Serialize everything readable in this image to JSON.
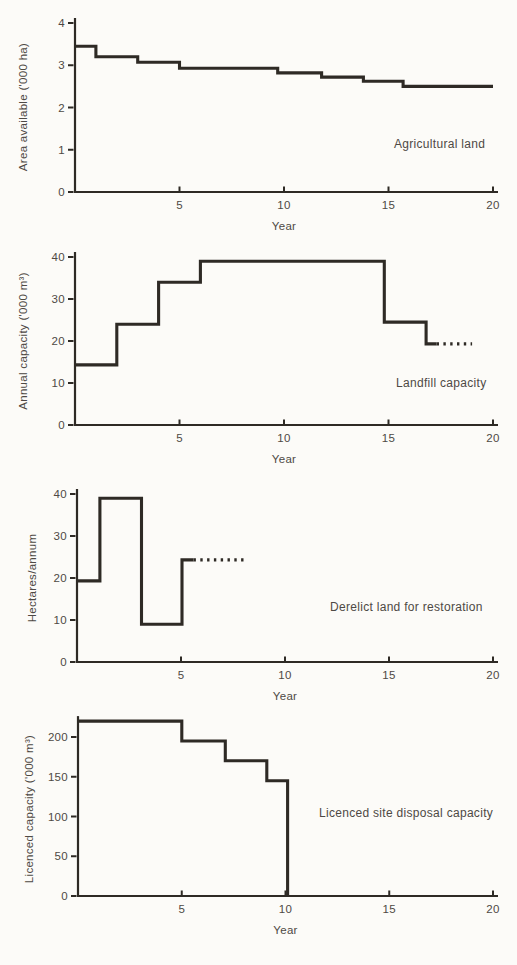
{
  "page": {
    "background": "#fcfbf8",
    "ink": "#2e2a25",
    "text_color": "#4e4944"
  },
  "chart_data": [
    {
      "type": "line",
      "subtype": "step",
      "title": "Agricultural land",
      "xlabel": "Year",
      "ylabel": "Area available ('000 ha)",
      "xlim": [
        0,
        20
      ],
      "ylim": [
        0,
        4
      ],
      "xticks": [
        5,
        10,
        15,
        20
      ],
      "yticks": [
        0,
        1,
        2,
        3,
        4
      ],
      "grid": false,
      "legend": "none",
      "annotation": "Agricultural land",
      "steps": [
        {
          "from": 0,
          "to": 1,
          "value": 3.45
        },
        {
          "from": 1,
          "to": 3,
          "value": 3.2
        },
        {
          "from": 3,
          "to": 5,
          "value": 3.07
        },
        {
          "from": 5,
          "to": 9.7,
          "value": 2.93
        },
        {
          "from": 9.7,
          "to": 11.8,
          "value": 2.82
        },
        {
          "from": 11.8,
          "to": 13.8,
          "value": 2.72
        },
        {
          "from": 13.8,
          "to": 15.7,
          "value": 2.62
        },
        {
          "from": 15.7,
          "to": 20,
          "value": 2.5
        }
      ],
      "dotted": null,
      "final_drop_to_zero": false
    },
    {
      "type": "line",
      "subtype": "step",
      "title": "Landfill capacity",
      "xlabel": "Year",
      "ylabel": "Annual capacity ('000 m³)",
      "xlim": [
        0,
        20
      ],
      "ylim": [
        0,
        40
      ],
      "xticks": [
        5,
        10,
        15,
        20
      ],
      "yticks": [
        0,
        10,
        20,
        30,
        40
      ],
      "grid": false,
      "legend": "none",
      "annotation": "Landfill capacity",
      "steps": [
        {
          "from": 0,
          "to": 2,
          "value": 14.3
        },
        {
          "from": 2,
          "to": 4,
          "value": 24
        },
        {
          "from": 4,
          "to": 6,
          "value": 34
        },
        {
          "from": 6,
          "to": 14.8,
          "value": 39
        },
        {
          "from": 14.8,
          "to": 16.8,
          "value": 24.5
        },
        {
          "from": 16.8,
          "to": 17.3,
          "value": 19.3
        }
      ],
      "dotted": {
        "from": 17.3,
        "to": 19,
        "value": 19.3
      },
      "final_drop_to_zero": false
    },
    {
      "type": "line",
      "subtype": "step",
      "title": "Derelict land for restoration",
      "xlabel": "Year",
      "ylabel": "Hectares/annum",
      "xlim": [
        0,
        20
      ],
      "ylim": [
        0,
        40
      ],
      "xticks": [
        5,
        10,
        15,
        20
      ],
      "yticks": [
        0,
        10,
        20,
        30,
        40
      ],
      "grid": false,
      "legend": "none",
      "annotation": "Derelict land for restoration",
      "steps": [
        {
          "from": 0,
          "to": 1.1,
          "value": 19.3
        },
        {
          "from": 1.1,
          "to": 3.1,
          "value": 39
        },
        {
          "from": 3.1,
          "to": 5.05,
          "value": 9
        },
        {
          "from": 5.05,
          "to": 5.6,
          "value": 24.3
        }
      ],
      "dotted": {
        "from": 5.6,
        "to": 8.2,
        "value": 24.3
      },
      "final_drop_to_zero": false
    },
    {
      "type": "line",
      "subtype": "step",
      "title": "Licenced site disposal capacity",
      "xlabel": "Year",
      "ylabel": "Licenced capacity ('000 m³)",
      "xlim": [
        0,
        20
      ],
      "ylim": [
        0,
        220
      ],
      "xticks": [
        5,
        10,
        15,
        20
      ],
      "yticks": [
        0,
        50,
        100,
        150,
        200
      ],
      "grid": false,
      "legend": "none",
      "annotation": "Licenced site disposal capacity",
      "steps": [
        {
          "from": 0,
          "to": 5,
          "value": 220
        },
        {
          "from": 5,
          "to": 7.1,
          "value": 195
        },
        {
          "from": 7.1,
          "to": 9.1,
          "value": 170
        },
        {
          "from": 9.1,
          "to": 10.1,
          "value": 145
        }
      ],
      "dotted": null,
      "final_drop_to_zero": true
    }
  ]
}
